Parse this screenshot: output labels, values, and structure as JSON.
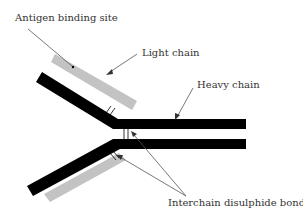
{
  "labels": {
    "antigen_binding_site": "Antigen binding site",
    "light_chain": "Light chain",
    "heavy_chain": "Heavy chain",
    "interchain_disulphide_bonds": "Interchain disulphide bonds"
  },
  "colors": {
    "heavy_chain": "#000000",
    "light_chain": "#c3c3c3",
    "arrow": "#555555",
    "text": "#333333",
    "background": "#ffffff"
  }
}
